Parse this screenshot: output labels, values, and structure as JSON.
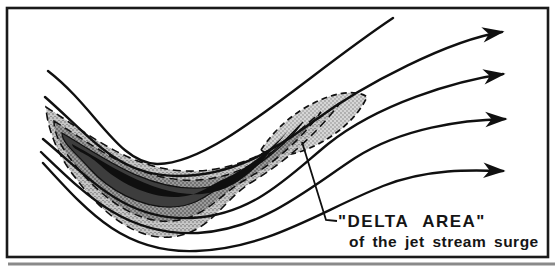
{
  "figure": {
    "label": {
      "line1": "\"DELTA AREA\"",
      "line2": "of the jet stream surge"
    },
    "colors": {
      "background": "#ffffff",
      "ink": "#101010",
      "frame": "#1a1a1a",
      "page_edge_shadow": "#8a8a8a",
      "delta_fill": "#d6d6d6",
      "band_outer": "#c6c6c6",
      "band_mid": "#9a9a9a",
      "band_dark": "#3d3d3d",
      "band_core": "#0f0f0f"
    },
    "flow": {
      "direction": "left-to-right",
      "arrow_count": 4,
      "streamline_count": 5
    }
  }
}
